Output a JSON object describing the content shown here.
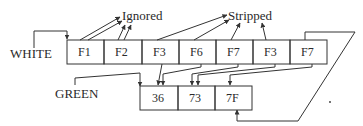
{
  "labels": {
    "ignored": "Ignored",
    "stripped": "Stripped",
    "white": "WHITE",
    "green": "GREEN"
  },
  "white_row": {
    "label": "WHITE",
    "cells": [
      "F1",
      "F2",
      "F3",
      "F6",
      "F7",
      "F3",
      "F7"
    ]
  },
  "green_row": {
    "label": "GREEN",
    "cells": [
      "36",
      "73",
      "7F"
    ]
  }
}
